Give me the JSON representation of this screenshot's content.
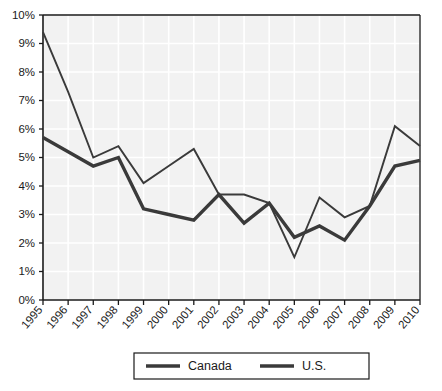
{
  "chart_data": {
    "type": "line",
    "title": "",
    "subtitle": "",
    "xlabel": "",
    "ylabel": "",
    "categories": [
      "1995",
      "1996",
      "1997",
      "1998",
      "1999",
      "2000",
      "2001",
      "2002",
      "2003",
      "2004",
      "2005",
      "2006",
      "2007",
      "2008",
      "2009",
      "2010"
    ],
    "ylim": [
      0,
      10
    ],
    "ytick_labels": [
      "0%",
      "1%",
      "2%",
      "3%",
      "4%",
      "5%",
      "6%",
      "7%",
      "8%",
      "9%",
      "10%"
    ],
    "ytick_values": [
      0,
      1,
      2,
      3,
      4,
      5,
      6,
      7,
      8,
      9,
      10
    ],
    "grid": true,
    "legend_position": "bottom",
    "series": [
      {
        "name": "Canada",
        "color": "#3a3a3a",
        "line_width": 3.4,
        "values": [
          5.7,
          5.2,
          4.7,
          5.0,
          3.2,
          3.0,
          2.8,
          3.7,
          2.7,
          3.4,
          2.2,
          2.6,
          2.1,
          3.3,
          4.7,
          4.9
        ]
      },
      {
        "name": "U.S.",
        "color": "#3a3a3a",
        "line_width": 1.9,
        "values": [
          9.4,
          7.3,
          5.0,
          5.4,
          4.1,
          4.7,
          5.3,
          3.7,
          3.7,
          3.4,
          1.5,
          3.6,
          2.9,
          3.3,
          6.1,
          5.4
        ]
      }
    ]
  },
  "legend": {
    "items": [
      {
        "label": "Canada"
      },
      {
        "label": "U.S."
      }
    ]
  },
  "colors": {
    "plot_background": "#f2f2f2",
    "gridline": "#ffffff",
    "axis": "#1a1a1a",
    "text": "#1a1a1a",
    "series_dark": "#3a3a3a"
  }
}
